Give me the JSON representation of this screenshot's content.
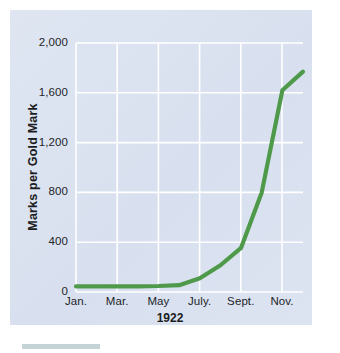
{
  "chart_data": {
    "type": "line",
    "title": "",
    "subtitle": "",
    "xlabel": "1922",
    "ylabel": "Marks per Gold Mark",
    "grid": true,
    "legend": null,
    "legend_position": "none",
    "line_color": "#4f9a4a",
    "panel_color": "#dde4f1",
    "gridline_color": "#ffffff",
    "ylim": [
      0,
      2000
    ],
    "yticks": [
      0,
      400,
      800,
      1200,
      1600,
      2000
    ],
    "ytick_labels": [
      "0",
      "400",
      "800",
      "1,200",
      "1,600",
      "2,000"
    ],
    "xtick_labels": [
      "Jan.",
      "Mar.",
      "May",
      "July.",
      "Sept.",
      "Nov."
    ],
    "x_months": [
      "Jan.",
      "Feb.",
      "Mar.",
      "Apr.",
      "May",
      "June",
      "July.",
      "Aug.",
      "Sept.",
      "Oct.",
      "Nov.",
      "Dec."
    ],
    "values": [
      45,
      45,
      45,
      45,
      48,
      55,
      110,
      215,
      355,
      800,
      1620,
      1770
    ],
    "annotations": []
  },
  "axis": {
    "y_title": "Marks per Gold Mark",
    "x_title": "1922"
  }
}
